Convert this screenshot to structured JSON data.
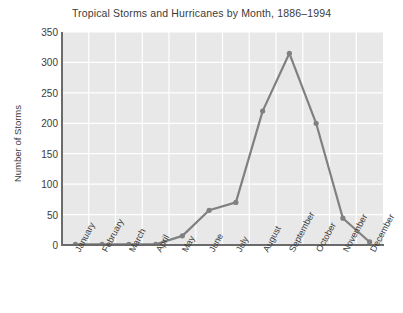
{
  "chart_data": {
    "type": "line",
    "title": "Tropical Storms and Hurricanes by Month, 1886–1994",
    "xlabel": "",
    "ylabel": "Number of Storms",
    "categories": [
      "January",
      "February",
      "March",
      "April",
      "May",
      "June",
      "July",
      "August",
      "September",
      "October",
      "November",
      "December"
    ],
    "values": [
      1,
      1,
      1,
      1,
      15,
      57,
      70,
      220,
      315,
      200,
      44,
      5
    ],
    "series": [
      {
        "name": "Number of Storms",
        "values": [
          1,
          1,
          1,
          1,
          15,
          57,
          70,
          220,
          315,
          200,
          44,
          5
        ]
      }
    ],
    "ylim": [
      0,
      350
    ],
    "yticks": [
      0,
      50,
      100,
      150,
      200,
      250,
      300,
      350
    ],
    "ytick_labels": [
      "0",
      "50",
      "100",
      "150",
      "200",
      "250",
      "300",
      "350"
    ],
    "grid": true,
    "grid_color": "#ffffff",
    "plot_background": "#e8e8e8",
    "line_color": "#808080",
    "marker_color": "#808080",
    "marker": "circle",
    "legend": "none"
  },
  "figure": {
    "background": "#ffffff",
    "text_color": "#3b3b3b"
  }
}
